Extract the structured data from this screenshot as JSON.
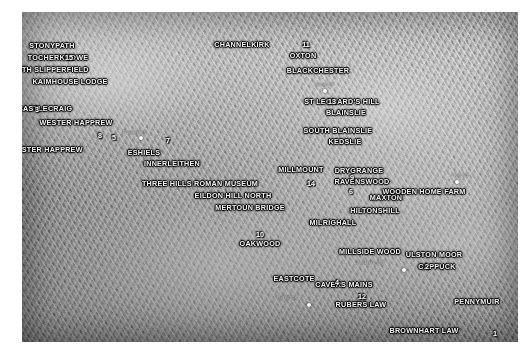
{
  "map": {
    "type": "shaded-relief-terrain-map",
    "region": "Scottish Borders",
    "background_color": "#ffffff",
    "terrain_palette": "grayscale-hillshade",
    "site_labels": [
      {
        "text": "STONYPATH",
        "x": 30,
        "y": 34
      },
      {
        "text": "TOCHERKNOWE",
        "x": 36,
        "y": 46
      },
      {
        "text": "NORTH SLIPPERFIELD",
        "x": 25,
        "y": 58
      },
      {
        "text": "KAIMHOUSE LODGE",
        "x": 48,
        "y": 70
      },
      {
        "text": "CASTLECRAIG",
        "x": 23,
        "y": 97
      },
      {
        "text": "WESTER HAPPREW",
        "x": 54,
        "y": 111
      },
      {
        "text": "EASTER HAPPREW",
        "x": 25,
        "y": 138
      },
      {
        "text": "ESHIELS",
        "x": 122,
        "y": 141
      },
      {
        "text": "INNERLEITHEN",
        "x": 150,
        "y": 152
      },
      {
        "text": "THREE HILLS ROMAN MUSEUM",
        "x": 178,
        "y": 172
      },
      {
        "text": "EILDON HILL NORTH",
        "x": 211,
        "y": 184
      },
      {
        "text": "MERTOUN BRIDGE",
        "x": 228,
        "y": 196
      },
      {
        "text": "MILLMOUNT",
        "x": 279,
        "y": 158
      },
      {
        "text": "CHANNELKIRK",
        "x": 220,
        "y": 33
      },
      {
        "text": "OXTON",
        "x": 281,
        "y": 44
      },
      {
        "text": "BLACKCHESTER",
        "x": 296,
        "y": 59
      },
      {
        "text": "ST LEONARD'S HILL",
        "x": 320,
        "y": 90
      },
      {
        "text": "BLAINSLIE",
        "x": 324,
        "y": 101
      },
      {
        "text": "SOUTH BLAINSLIE",
        "x": 316,
        "y": 119
      },
      {
        "text": "KEDSLIE",
        "x": 323,
        "y": 130
      },
      {
        "text": "DRYGRANGE",
        "x": 337,
        "y": 159
      },
      {
        "text": "RAVENSWOOD",
        "x": 340,
        "y": 170
      },
      {
        "text": "MAXTON",
        "x": 364,
        "y": 186
      },
      {
        "text": "WOODEN HOME FARM",
        "x": 402,
        "y": 180
      },
      {
        "text": "HILTONSHILL",
        "x": 353,
        "y": 199
      },
      {
        "text": "MILRIGHALL",
        "x": 311,
        "y": 211
      },
      {
        "text": "OAKWOOD",
        "x": 238,
        "y": 232
      },
      {
        "text": "EASTCOTE",
        "x": 272,
        "y": 267
      },
      {
        "text": "CAVERS MAINS",
        "x": 322,
        "y": 273
      },
      {
        "text": "RUBERS LAW",
        "x": 339,
        "y": 293
      },
      {
        "text": "MILLSIDE WOOD",
        "x": 348,
        "y": 240
      },
      {
        "text": "ULSTON MOOR",
        "x": 412,
        "y": 243
      },
      {
        "text": "CAPPUCK",
        "x": 415,
        "y": 255
      },
      {
        "text": "PENNYMUIR",
        "x": 455,
        "y": 290
      },
      {
        "text": "BROWNHART LAW",
        "x": 402,
        "y": 319
      }
    ],
    "site_numbers": [
      {
        "text": "15",
        "x": 47,
        "y": 46
      },
      {
        "text": "3",
        "x": 15,
        "y": 98
      },
      {
        "text": "8",
        "x": 78,
        "y": 124
      },
      {
        "text": "5",
        "x": 92,
        "y": 126
      },
      {
        "text": "7",
        "x": 146,
        "y": 129
      },
      {
        "text": "11",
        "x": 284,
        "y": 33
      },
      {
        "text": "13",
        "x": 310,
        "y": 90
      },
      {
        "text": "14",
        "x": 289,
        "y": 172
      },
      {
        "text": "9",
        "x": 330,
        "y": 166
      },
      {
        "text": "6",
        "x": 329,
        "y": 180
      },
      {
        "text": "10",
        "x": 238,
        "y": 223
      },
      {
        "text": "4",
        "x": 315,
        "y": 271
      },
      {
        "text": "12",
        "x": 340,
        "y": 285
      },
      {
        "text": "2",
        "x": 405,
        "y": 255
      },
      {
        "text": "1",
        "x": 473,
        "y": 322
      }
    ],
    "town_labels": [
      {
        "text": "Peebles",
        "x": 113,
        "y": 120
      },
      {
        "text": "Lauder",
        "x": 302,
        "y": 72
      },
      {
        "text": "Kelso",
        "x": 440,
        "y": 163
      },
      {
        "text": "Hawick",
        "x": 265,
        "y": 285
      },
      {
        "text": "Jedburgh",
        "x": 348,
        "y": 250
      }
    ],
    "town_markers": [
      {
        "name": "peebles-marker",
        "x": 119,
        "y": 126
      },
      {
        "name": "lauder-marker",
        "x": 303,
        "y": 79
      },
      {
        "name": "kelso-marker",
        "x": 435,
        "y": 170
      },
      {
        "name": "hawick-marker",
        "x": 287,
        "y": 293
      },
      {
        "name": "jedburgh-marker",
        "x": 382,
        "y": 258
      }
    ]
  }
}
